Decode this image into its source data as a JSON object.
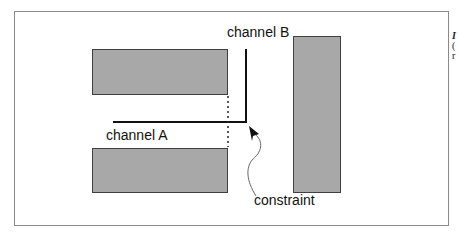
{
  "diagram": {
    "labels": {
      "channel_a": "channel A",
      "channel_b": "channel B",
      "constraint": "constraint"
    },
    "blocks": [
      {
        "name": "top-left-block",
        "x": 92,
        "y": 49,
        "w": 136,
        "h": 46
      },
      {
        "name": "bottom-left-block",
        "x": 92,
        "y": 148,
        "w": 136,
        "h": 45
      },
      {
        "name": "right-block",
        "x": 293,
        "y": 36,
        "w": 48,
        "h": 157
      }
    ],
    "colors": {
      "block_fill": "#a8a8a8",
      "block_stroke": "#404040",
      "line": "#111111",
      "frame": "#8a8a8a"
    },
    "caption_fragments": [
      "I",
      "(",
      "r"
    ]
  }
}
